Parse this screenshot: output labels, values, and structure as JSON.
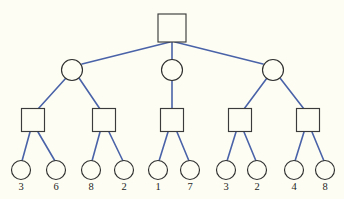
{
  "figure": {
    "background_color": "#fdfdf4",
    "edge_color": "#4a63a8",
    "node_outline_color": "#2f2f2f",
    "node_fill_color": "#fdfdf4"
  },
  "tree": {
    "levels": 4,
    "level_1": {
      "shape": "square",
      "nodes": [
        {
          "id": "root",
          "label": "",
          "cx": 172,
          "cy": 28,
          "size": 28
        }
      ]
    },
    "level_2": {
      "shape": "circle",
      "nodes": [
        {
          "id": "n2-1",
          "label": "",
          "cx": 72,
          "cy": 70,
          "r": 10.5
        },
        {
          "id": "n2-2",
          "label": "",
          "cx": 172,
          "cy": 70,
          "r": 10.5
        },
        {
          "id": "n2-3",
          "label": "",
          "cx": 273,
          "cy": 70,
          "r": 10.5
        }
      ]
    },
    "level_3": {
      "shape": "square",
      "nodes": [
        {
          "id": "n3-1",
          "label": "",
          "cx": 33,
          "cy": 120,
          "size": 23
        },
        {
          "id": "n3-2",
          "label": "",
          "cx": 104,
          "cy": 120,
          "size": 23
        },
        {
          "id": "n3-3",
          "label": "",
          "cx": 172,
          "cy": 120,
          "size": 23
        },
        {
          "id": "n3-4",
          "label": "",
          "cx": 240,
          "cy": 120,
          "size": 23
        },
        {
          "id": "n3-5",
          "label": "",
          "cx": 308,
          "cy": 120,
          "size": 23
        }
      ]
    },
    "level_4": {
      "shape": "circle",
      "nodes": [
        {
          "id": "leaf-1",
          "label": "3",
          "cx": 21,
          "cy": 170,
          "r": 9.5
        },
        {
          "id": "leaf-2",
          "label": "6",
          "cx": 56,
          "cy": 170,
          "r": 9.5
        },
        {
          "id": "leaf-3",
          "label": "8",
          "cx": 91,
          "cy": 170,
          "r": 9.5
        },
        {
          "id": "leaf-4",
          "label": "2",
          "cx": 124,
          "cy": 170,
          "r": 9.5
        },
        {
          "id": "leaf-5",
          "label": "1",
          "cx": 158,
          "cy": 170,
          "r": 9.5
        },
        {
          "id": "leaf-6",
          "label": "7",
          "cx": 190,
          "cy": 170,
          "r": 9.5
        },
        {
          "id": "leaf-7",
          "label": "3",
          "cx": 226,
          "cy": 170,
          "r": 9.5
        },
        {
          "id": "leaf-8",
          "label": "2",
          "cx": 257,
          "cy": 170,
          "r": 9.5
        },
        {
          "id": "leaf-9",
          "label": "4",
          "cx": 294,
          "cy": 170,
          "r": 9.5
        },
        {
          "id": "leaf-10",
          "label": "8",
          "cx": 325,
          "cy": 170,
          "r": 9.5
        }
      ]
    }
  },
  "leaf_values": [
    "3",
    "6",
    "8",
    "2",
    "1",
    "7",
    "3",
    "2",
    "4",
    "8"
  ],
  "label_y": 187
}
